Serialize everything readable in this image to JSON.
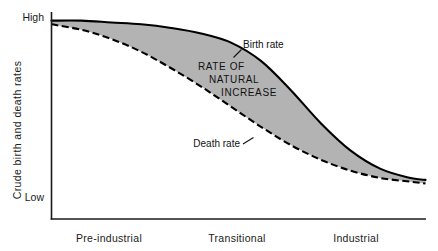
{
  "chart_data": {
    "type": "line",
    "title": "",
    "xlabel": "",
    "ylabel": "Crude birth and death rates",
    "grid": false,
    "legend_position": "inline-annotations",
    "y_tick_labels": [
      "High",
      "Low"
    ],
    "ylim": [
      "Low",
      "High"
    ],
    "categories": [
      "Pre-industrial",
      "Transitional",
      "Industrial"
    ],
    "series": [
      {
        "name": "Birth rate",
        "style": "solid",
        "color": "#000000",
        "x": [
          0,
          8,
          16,
          24,
          32,
          40,
          48,
          56,
          64,
          72,
          80,
          88,
          96,
          100
        ],
        "values": [
          98,
          98,
          97,
          96,
          94,
          91,
          86,
          76,
          60,
          42,
          27,
          17,
          12,
          11
        ]
      },
      {
        "name": "Death rate",
        "style": "dashed",
        "color": "#000000",
        "x": [
          0,
          8,
          16,
          24,
          32,
          40,
          48,
          56,
          64,
          72,
          80,
          88,
          96,
          100
        ],
        "values": [
          96,
          93,
          88,
          81,
          72,
          62,
          51,
          40,
          30,
          22,
          16,
          12,
          10,
          9
        ]
      }
    ],
    "band": {
      "name": "RATE OF NATURAL INCREASE",
      "between": [
        "Birth rate",
        "Death rate"
      ],
      "fill": "#b3b3b3"
    },
    "annotations": [
      {
        "id": "birth-rate-label",
        "text": "Birth rate",
        "x": 243,
        "y": 48
      },
      {
        "id": "death-rate-label",
        "text": "Death rate",
        "x": 172,
        "y": 147
      },
      {
        "id": "rni-line-1",
        "text": "RATE  OF",
        "x": 198,
        "y": 70
      },
      {
        "id": "rni-line-2",
        "text": "NATURAL",
        "x": 209,
        "y": 83
      },
      {
        "id": "rni-line-3",
        "text": "INCREASE",
        "x": 221,
        "y": 96
      }
    ]
  },
  "axes": {
    "y_label": "Crude birth and death rates",
    "y_high": "High",
    "y_low": "Low",
    "x_categories": [
      {
        "label": "Pre-industrial",
        "center": 109
      },
      {
        "label": "Transitional",
        "center": 237
      },
      {
        "label": "Industrial",
        "center": 356
      }
    ]
  },
  "colors": {
    "band_fill": "#b3b3b3",
    "curve": "#000000",
    "axis": "#1a1a1a",
    "background": "#ffffff"
  }
}
